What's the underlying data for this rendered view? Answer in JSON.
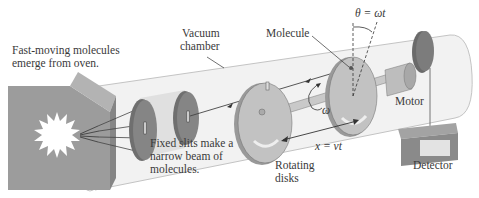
{
  "diagram": {
    "labels": {
      "oven_line1": "Fast-moving molecules",
      "oven_line2": "emerge from oven.",
      "vacuum_line1": "Vacuum",
      "vacuum_line2": "chamber",
      "molecule": "Molecule",
      "theta_eq": "θ = ωt",
      "omega": "ω",
      "motor": "Motor",
      "slits_line1": "Fixed slits make a",
      "slits_line2": "narrow beam of",
      "slits_line3": "molecules.",
      "distance_eq": "x = vt",
      "disks_line1": "Rotating",
      "disks_line2": "disks",
      "detector": "Detector"
    },
    "colors": {
      "chamber_fill": "#f1f1f1",
      "chamber_stroke": "#bdbdbd",
      "oven_fill": "#9a9a9a",
      "slit_disk": "#7d7d7d",
      "rotating_disk": "#b8b8b8",
      "detector_fill": "#8a8a8a",
      "text": "#3a3a3a"
    }
  }
}
